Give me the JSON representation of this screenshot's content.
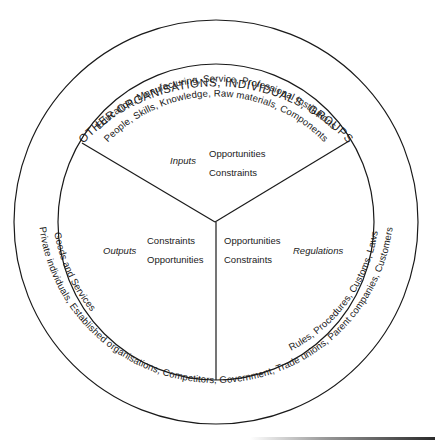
{
  "diagram": {
    "outer_ring_label": "OTHER ORGANISATIONS, INDIVIDUALS, GROUPS",
    "top_band": {
      "outer": "Education, Manufacturing, Service, Professional Institutions",
      "inner": "People, Skills, Knowledge, Raw materials, Components"
    },
    "bottom_band": {
      "outer": "Private individuals, Established organisations, Competitors, Government, Trade unions, Parent companies, Customers",
      "left_inner": "Goods and Services",
      "right_inner": "Rules, Procedures, Customs, Laws"
    },
    "segments": {
      "inputs": {
        "title": "Inputs",
        "line1": "Opportunities",
        "line2": "Constraints"
      },
      "outputs": {
        "title": "Outputs",
        "line1": "Constraints",
        "line2": "Opportunities"
      },
      "regulations": {
        "title": "Regulations",
        "line1": "Opportunities",
        "line2": "Constraints"
      }
    },
    "colors": {
      "ink": "#1a1a1a",
      "background": "#ffffff"
    }
  }
}
